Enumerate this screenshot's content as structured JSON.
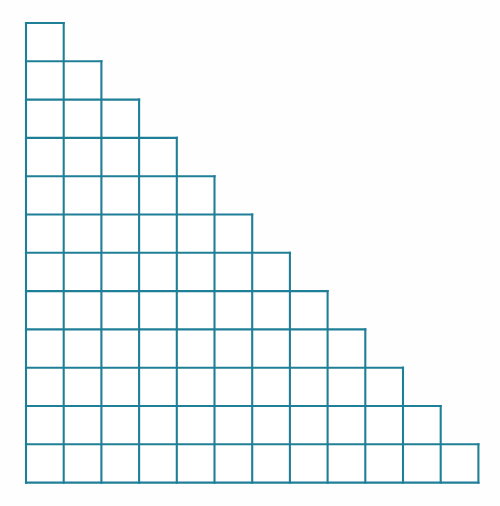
{
  "figure": {
    "name": "staircase-grid",
    "shape_type": "triangular-staircase",
    "rows": 12,
    "columns": 12,
    "total_cells": 78,
    "row_cell_counts": [
      1,
      2,
      3,
      4,
      5,
      6,
      7,
      8,
      9,
      10,
      11,
      12
    ],
    "geometry": {
      "origin_x": 26,
      "origin_y": 23,
      "cell_width": 37.7,
      "cell_height": 38.3,
      "grid_right_edge": 478.4,
      "grid_bottom_edge": 482.6
    },
    "style": {
      "line_color": "#1f7f97",
      "line_width": 2.1,
      "cell_fill": "#ffffff",
      "background_color": "#fefefe"
    }
  },
  "chart_data": {
    "type": "bar",
    "title": "",
    "subtitle": "",
    "xlabel": "",
    "ylabel": "",
    "categories": [
      "1",
      "2",
      "3",
      "4",
      "5",
      "6",
      "7",
      "8",
      "9",
      "10",
      "11",
      "12"
    ],
    "values": [
      1,
      2,
      3,
      4,
      5,
      6,
      7,
      8,
      9,
      10,
      11,
      12
    ],
    "xlim": [
      0,
      12
    ],
    "ylim": [
      0,
      12
    ],
    "grid": true,
    "legend": null,
    "annotations": [],
    "orientation": "horizontal-rows"
  }
}
